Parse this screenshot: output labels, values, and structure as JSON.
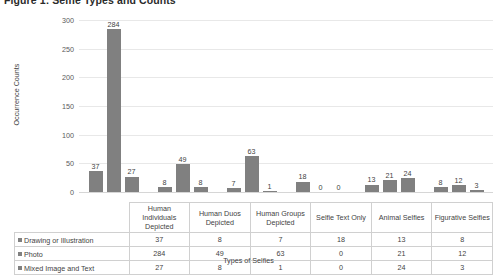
{
  "figure": {
    "caption": "Figure 1: Selfie Types and Counts"
  },
  "axes": {
    "y_title": "Occurrence Counts",
    "x_title": "Types of Selfies",
    "y_ticks": [
      "0",
      "50",
      "100",
      "150",
      "200",
      "250",
      "300"
    ]
  },
  "table": {
    "corner": "",
    "headers": [
      "Human Individuals Depicted",
      "Human Duos Depicted",
      "Human Groups Depicted",
      "Selfie Text Only",
      "Animal Selfies",
      "Figurative Selfies"
    ],
    "rows": [
      {
        "label": "Drawing or Illustration",
        "values": [
          "37",
          "8",
          "7",
          "18",
          "13",
          "8"
        ]
      },
      {
        "label": "Photo",
        "values": [
          "284",
          "49",
          "63",
          "0",
          "21",
          "12"
        ]
      },
      {
        "label": "Mixed Image and Text",
        "values": [
          "27",
          "8",
          "1",
          "0",
          "24",
          "3"
        ]
      }
    ]
  },
  "chart_data": {
    "type": "bar",
    "title": "Figure 1: Selfie Types and Counts",
    "xlabel": "Types of Selfies",
    "ylabel": "Occurrence Counts",
    "ylim": [
      0,
      300
    ],
    "yticks": [
      0,
      50,
      100,
      150,
      200,
      250,
      300
    ],
    "grid": true,
    "legend_position": "table-left",
    "bar_color": "#808080",
    "categories": [
      "Human Individuals Depicted",
      "Human Duos Depicted",
      "Human Groups Depicted",
      "Selfie Text Only",
      "Animal Selfies",
      "Figurative Selfies"
    ],
    "series": [
      {
        "name": "Drawing or Illustration",
        "values": [
          37,
          8,
          7,
          18,
          13,
          8
        ]
      },
      {
        "name": "Photo",
        "values": [
          284,
          49,
          63,
          0,
          21,
          12
        ]
      },
      {
        "name": "Mixed Image and Text",
        "values": [
          27,
          8,
          1,
          0,
          24,
          3
        ]
      }
    ]
  }
}
